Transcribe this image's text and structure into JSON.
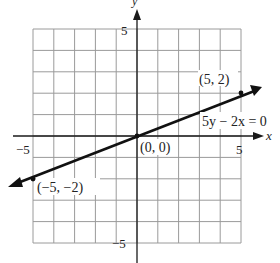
{
  "chart_data": {
    "type": "line",
    "title": "",
    "xlabel": "x",
    "ylabel": "y",
    "xlim": [
      -5,
      5
    ],
    "ylim": [
      -5,
      5
    ],
    "grid": true,
    "x_ticks_labeled": [
      -5,
      5
    ],
    "y_ticks_labeled": [
      5,
      -5
    ],
    "series": [
      {
        "name": "5y − 2x = 0",
        "equation": "y = 2x/5",
        "points": [
          [
            -5,
            -2
          ],
          [
            0,
            0
          ],
          [
            5,
            2
          ]
        ],
        "point_labels": [
          "(−5, −2)",
          "(0, 0)",
          "(5, 2)"
        ]
      }
    ],
    "annotations": [
      "5y − 2x = 0",
      "(5, 2)",
      "(0, 0)",
      "(−5, −2)"
    ]
  },
  "labels": {
    "x_axis": "x",
    "y_axis": "y",
    "x_tick_neg": "−5",
    "x_tick_pos": "5",
    "y_tick_pos": "5",
    "y_tick_neg": "−5",
    "equation": "5y − 2x = 0",
    "pt_pos": "(5, 2)",
    "pt_origin": "(0, 0)",
    "pt_neg": "(−5, −2)"
  },
  "colors": {
    "grid": "#9a9a9a",
    "axis": "#1a1a1a",
    "line": "#111111"
  }
}
